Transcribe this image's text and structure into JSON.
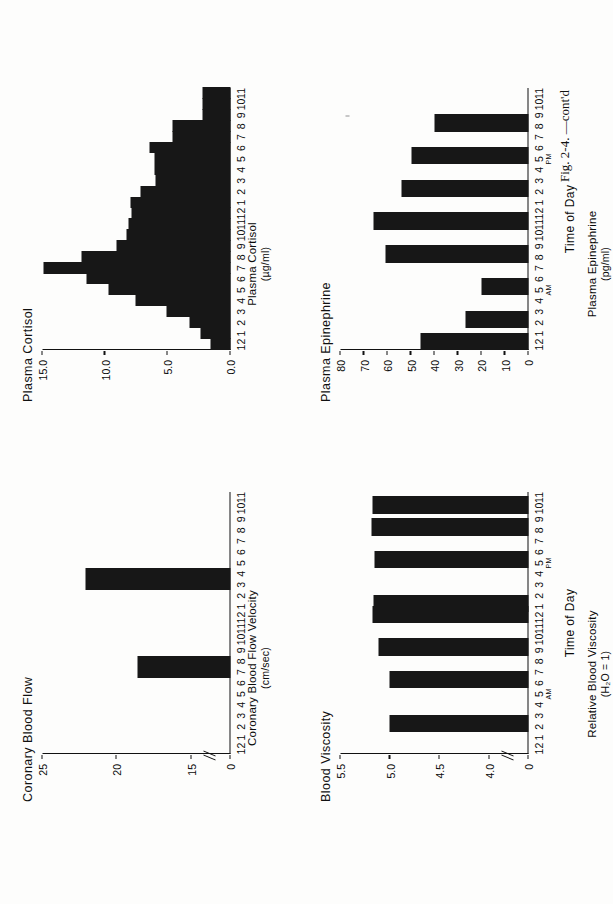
{
  "figure": {
    "caption": "Fig. 2-4.  —cont'd",
    "xaxis_title": "Time of Day",
    "ampm": {
      "am": "AM",
      "pm": "PM"
    },
    "time_ticks": [
      "12",
      "1",
      "2",
      "3",
      "4",
      "5",
      "6",
      "7",
      "8",
      "9",
      "10",
      "11",
      "12",
      "1",
      "2",
      "3",
      "4",
      "5",
      "6",
      "7",
      "8",
      "9",
      "10",
      "11"
    ]
  },
  "panels": [
    {
      "key": "coronary_blood_flow",
      "title": "Coronary Blood Flow",
      "ylabel": "Coronary Blood Flow Velocity",
      "yunit": "(cm/sec)",
      "yticks": [
        "25",
        "20",
        "15",
        "0"
      ],
      "axis_break": true
    },
    {
      "key": "plasma_cortisol",
      "title": "Plasma Cortisol",
      "ylabel": "Plasma Cortisol",
      "yunit": "(µg/ml)",
      "yticks": [
        "15.0",
        "10.0",
        "5.0",
        "0.0"
      ],
      "axis_break": false
    },
    {
      "key": "blood_viscosity",
      "title": "Blood Viscosity",
      "ylabel": "Relative Blood Viscosity",
      "yunit": "(H₂O = 1)",
      "yticks": [
        "5.5",
        "5.0",
        "4.5",
        "4.0",
        "0"
      ],
      "axis_break": true
    },
    {
      "key": "plasma_epinephrine",
      "title": "Plasma Epinephrine",
      "ylabel": "Plasma Epinephrine",
      "yunit": "(pg/ml)",
      "yticks": [
        "80",
        "70",
        "60",
        "50",
        "40",
        "30",
        "20",
        "10",
        "0"
      ],
      "axis_break": false
    }
  ],
  "chart_data": [
    {
      "type": "bar",
      "key": "coronary_blood_flow",
      "title": "Coronary Blood Flow",
      "xlabel": "Time of Day",
      "ylabel": "Coronary Blood Flow Velocity (cm/sec)",
      "ylim": [
        0,
        25
      ],
      "broken_axis_from": 0,
      "broken_axis_to": 14,
      "yticks": [
        25,
        20,
        15,
        0
      ],
      "grid": false,
      "legend": "none",
      "categories": [
        "12",
        "1",
        "2",
        "3",
        "4",
        "5",
        "6",
        "7",
        "8",
        "9",
        "10",
        "11",
        "12",
        "1",
        "2",
        "3",
        "4",
        "5",
        "6",
        "7",
        "8",
        "9",
        "10",
        "11"
      ],
      "bars": [
        {
          "x": "7-8 AM",
          "x_index": 7,
          "value": 18.6,
          "width_hours": 2
        },
        {
          "x": "3-4 PM",
          "x_index": 15,
          "value": 22.1,
          "width_hours": 2
        }
      ]
    },
    {
      "type": "bar",
      "key": "plasma_cortisol",
      "title": "Plasma Cortisol",
      "xlabel": "Time of Day",
      "ylabel": "Plasma Cortisol (µg/ml)",
      "ylim": [
        0,
        15
      ],
      "yticks": [
        15.0,
        10.0,
        5.0,
        0.0
      ],
      "grid": false,
      "legend": "none",
      "categories": [
        "12",
        "1",
        "2",
        "3",
        "4",
        "5",
        "6",
        "7",
        "8",
        "9",
        "10",
        "11",
        "12",
        "1",
        "2",
        "3",
        "4",
        "5",
        "6",
        "7",
        "8",
        "9",
        "10",
        "11"
      ],
      "values": [
        1.6,
        2.4,
        3.3,
        5.1,
        7.6,
        9.7,
        11.5,
        14.9,
        11.9,
        9.1,
        8.3,
        8.1,
        7.9,
        8.0,
        7.2,
        6.0,
        6.1,
        6.1,
        6.5,
        4.6,
        4.6,
        2.2,
        2.2,
        2.2
      ]
    },
    {
      "type": "bar",
      "key": "blood_viscosity",
      "title": "Blood Viscosity",
      "xlabel": "Time of Day",
      "ylabel": "Relative Blood Viscosity (H₂O = 1)",
      "ylim": [
        0,
        5.5
      ],
      "broken_axis_from": 0,
      "broken_axis_to": 3.85,
      "yticks": [
        5.5,
        5.0,
        4.5,
        4.0,
        0
      ],
      "grid": false,
      "legend": "none",
      "categories": [
        "12",
        "1",
        "2",
        "3",
        "4",
        "5",
        "6",
        "7",
        "8",
        "9",
        "10",
        "11",
        "12",
        "1",
        "2",
        "3",
        "4",
        "5",
        "6",
        "7",
        "8",
        "9",
        "10",
        "11"
      ],
      "bars": [
        {
          "x": "2-3 AM",
          "x_index": 2,
          "value": 5.01,
          "width_hours": 1.6
        },
        {
          "x": "6-7 AM",
          "x_index": 6,
          "value": 5.01,
          "width_hours": 1.6
        },
        {
          "x": "9-10 AM",
          "x_index": 9,
          "value": 5.12,
          "width_hours": 1.6
        },
        {
          "x": "12-1 PM",
          "x_index": 12,
          "value": 5.18,
          "width_hours": 1.6
        },
        {
          "x": "1-2 PM",
          "x_index": 13,
          "value": 5.17,
          "width_hours": 1.6
        },
        {
          "x": "5-6 PM",
          "x_index": 17,
          "value": 5.16,
          "width_hours": 1.6
        },
        {
          "x": "8-9 PM",
          "x_index": 20,
          "value": 5.19,
          "width_hours": 1.6
        },
        {
          "x": "10-11 PM",
          "x_index": 22,
          "value": 5.18,
          "width_hours": 1.6
        }
      ]
    },
    {
      "type": "bar",
      "key": "plasma_epinephrine",
      "title": "Plasma Epinephrine",
      "xlabel": "Time of Day",
      "ylabel": "Plasma Epinephrine (pg/ml)",
      "ylim": [
        0,
        80
      ],
      "yticks": [
        80,
        70,
        60,
        50,
        40,
        30,
        20,
        10,
        0
      ],
      "grid": false,
      "legend": "none",
      "categories": [
        "12",
        "1",
        "2",
        "3",
        "4",
        "5",
        "6",
        "7",
        "8",
        "9",
        "10",
        "11",
        "12",
        "1",
        "2",
        "3",
        "4",
        "5",
        "6",
        "7",
        "8",
        "9",
        "10",
        "11"
      ],
      "bars": [
        {
          "x": "12-1 AM",
          "x_index": 0,
          "value": 46,
          "width_hours": 1.6
        },
        {
          "x": "2-3 AM",
          "x_index": 2,
          "value": 27,
          "width_hours": 1.6
        },
        {
          "x": "5-6 AM",
          "x_index": 5,
          "value": 20,
          "width_hours": 1.6
        },
        {
          "x": "8-9 AM",
          "x_index": 8,
          "value": 61,
          "width_hours": 1.6
        },
        {
          "x": "11-12 AM",
          "x_index": 11,
          "value": 66,
          "width_hours": 1.6
        },
        {
          "x": "2-3 PM",
          "x_index": 14,
          "value": 54,
          "width_hours": 1.6
        },
        {
          "x": "5-6 PM",
          "x_index": 17,
          "value": 50,
          "width_hours": 1.6
        },
        {
          "x": "8-9 PM",
          "x_index": 20,
          "value": 40,
          "width_hours": 1.6
        }
      ]
    }
  ]
}
